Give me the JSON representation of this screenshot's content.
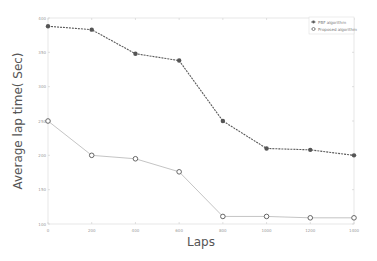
{
  "chart_data": {
    "type": "line",
    "title": "",
    "xlabel": "Laps",
    "ylabel": "Average lap time( Sec)",
    "x": [
      0,
      200,
      400,
      600,
      800,
      1000,
      1200,
      1400
    ],
    "xticks": [
      "0",
      "200",
      "400",
      "600",
      "800",
      "1000",
      "1200",
      "1400"
    ],
    "yticks": [
      "100",
      "150",
      "200",
      "250",
      "300",
      "350",
      "400"
    ],
    "xlim": [
      0,
      1400
    ],
    "ylim": [
      100,
      400
    ],
    "grid": false,
    "legend_position": "upper right",
    "series": [
      {
        "name": "PBF algorithm",
        "values": [
          388,
          383,
          348,
          338,
          250,
          210,
          208,
          200
        ],
        "color": "#5a5a5a",
        "line_style": "dashed",
        "marker": "filled-circle"
      },
      {
        "name": "Proposed algorithm",
        "values": [
          250,
          200,
          195,
          176,
          111,
          111,
          109,
          109
        ],
        "color": "#bdbdbd",
        "line_style": "solid",
        "marker": "hollow-circle"
      }
    ]
  },
  "legend": {
    "items": [
      {
        "label": "PBF algorithm"
      },
      {
        "label": "Proposed algorithm"
      }
    ]
  },
  "axes": {
    "xlabel": "Laps",
    "ylabel": "Average lap time( Sec)"
  }
}
